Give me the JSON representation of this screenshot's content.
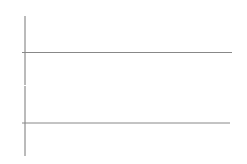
{
  "top_plot": {
    "y_axis_label": "u",
    "y_axis_sub": "d",
    "origin_label": "O",
    "x_axis_label": "ωt",
    "curves": [
      {
        "name": "u",
        "sub": "a",
        "phase_deg": 0
      },
      {
        "name": "u",
        "sub": "b",
        "phase_deg": -120
      },
      {
        "name": "u",
        "sub": "c",
        "phase_deg": 120
      }
    ]
  },
  "bottom_plot": {
    "y_axis_label": "u",
    "y_axis_sub": "d",
    "origin_label": "O",
    "x_axis_label": "ωt",
    "curves": [
      {
        "name": "u",
        "sub": "a",
        "style": "dashed"
      },
      {
        "name": "u",
        "sub": "b",
        "style": "dashed"
      },
      {
        "name": "u",
        "sub": "c",
        "style": "dashed"
      }
    ],
    "output_waveform": "bold segments following u_c, u_b with vertical jumps at u_c troughs"
  },
  "colors": {
    "line": "#222222",
    "axis": "#888888",
    "dashed": "#999999"
  }
}
